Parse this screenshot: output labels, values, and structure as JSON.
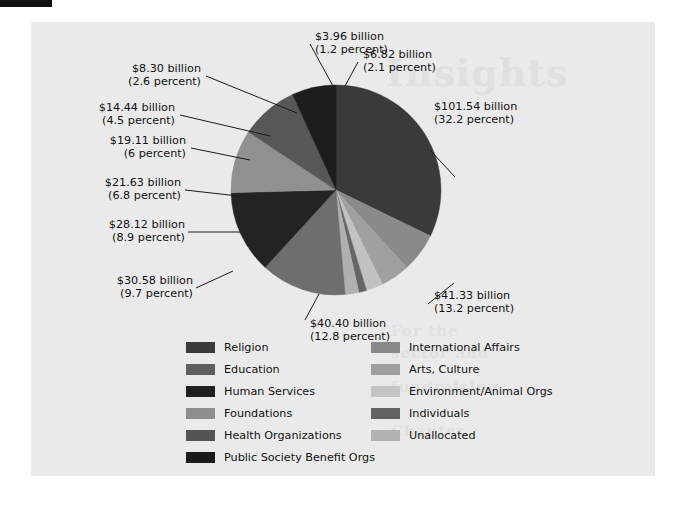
{
  "figure": {
    "background_color": "#eaeaea",
    "page_color": "#ffffff"
  },
  "ghost_text": {
    "line1": "Insights",
    "line2": "For the",
    "line3": "sector and",
    "line4": "fundraising",
    "line5": "Chapter"
  },
  "chart_data": {
    "type": "pie",
    "title": "",
    "subtitle": "",
    "xlabel": "",
    "ylabel": "",
    "legend_position": "bottom",
    "grid": false,
    "value_unit": "billion USD",
    "categories": [
      "Religion",
      "Education",
      "Human Services",
      "Foundations",
      "Health Organizations",
      "Public Society Benefit Orgs",
      "International Affairs",
      "Arts, Culture",
      "Environment/Animal Orgs",
      "Individuals",
      "Unallocated"
    ],
    "values": [
      101.54,
      41.33,
      40.4,
      30.58,
      28.12,
      21.63,
      19.11,
      14.44,
      8.3,
      3.96,
      6.82
    ],
    "percents": [
      32.2,
      13.2,
      12.8,
      9.7,
      8.9,
      6.8,
      6.0,
      4.5,
      2.6,
      1.2,
      2.1
    ],
    "colors": [
      "#3a3a3a",
      "#6e6e6e",
      "#232323",
      "#909090",
      "#575757",
      "#1d1d1d",
      "#8a8a8a",
      "#a0a0a0",
      "#c2c2c2",
      "#666666",
      "#b0b0b0"
    ],
    "slices": [
      {
        "name": "Religion",
        "value": 101.54,
        "percent": 32.2,
        "value_text": "$101.54 billion",
        "percent_text": "(32.2 percent)",
        "color": "#3a3a3a"
      },
      {
        "name": "International Affairs",
        "value": 19.11,
        "percent": 6.0,
        "value_text": "$19.11 billion",
        "percent_text": "(6 percent)",
        "color": "#8a8a8a"
      },
      {
        "name": "Arts, Culture",
        "value": 14.44,
        "percent": 4.5,
        "value_text": "$14.44 billion",
        "percent_text": "(4.5 percent)",
        "color": "#a0a0a0"
      },
      {
        "name": "Environment/Animal Orgs",
        "value": 8.3,
        "percent": 2.6,
        "value_text": "$8.30 billion",
        "percent_text": "(2.6 percent)",
        "color": "#c2c2c2"
      },
      {
        "name": "Individuals",
        "value": 3.96,
        "percent": 1.2,
        "value_text": "$3.96 billion",
        "percent_text": "(1.2 percent)",
        "color": "#666666"
      },
      {
        "name": "Unallocated",
        "value": 6.82,
        "percent": 2.1,
        "value_text": "$6.82 billion",
        "percent_text": "(2.1 percent)",
        "color": "#b0b0b0"
      },
      {
        "name": "Education",
        "value": 41.33,
        "percent": 13.2,
        "value_text": "$41.33 billion",
        "percent_text": "(13.2 percent)",
        "color": "#6e6e6e"
      },
      {
        "name": "Human Services",
        "value": 40.4,
        "percent": 12.8,
        "value_text": "$40.40 billion",
        "percent_text": "(12.8 percent)",
        "color": "#232323"
      },
      {
        "name": "Foundations",
        "value": 30.58,
        "percent": 9.7,
        "value_text": "$30.58 billion",
        "percent_text": "(9.7 percent)",
        "color": "#909090"
      },
      {
        "name": "Health Organizations",
        "value": 28.12,
        "percent": 8.9,
        "value_text": "$28.12 billion",
        "percent_text": "(8.9 percent)",
        "color": "#575757"
      },
      {
        "name": "Public Society Benefit Orgs",
        "value": 21.63,
        "percent": 6.8,
        "value_text": "$21.63 billion",
        "percent_text": "(6.8 percent)",
        "color": "#1d1d1d"
      }
    ]
  },
  "callouts": [
    {
      "id": "religion",
      "value_text": "$101.54 billion",
      "percent_text": "(32.2 percent)"
    },
    {
      "id": "education",
      "value_text": "$41.33 billion",
      "percent_text": "(13.2 percent)"
    },
    {
      "id": "human",
      "value_text": "$40.40 billion",
      "percent_text": "(12.8 percent)"
    },
    {
      "id": "foundations",
      "value_text": "$30.58 billion",
      "percent_text": "(9.7 percent)"
    },
    {
      "id": "health",
      "value_text": "$28.12 billion",
      "percent_text": "(8.9 percent)"
    },
    {
      "id": "public",
      "value_text": "$21.63 billion",
      "percent_text": "(6.8 percent)"
    },
    {
      "id": "intl",
      "value_text": "$19.11 billion",
      "percent_text": "(6 percent)"
    },
    {
      "id": "arts",
      "value_text": "$14.44 billion",
      "percent_text": "(4.5 percent)"
    },
    {
      "id": "environment",
      "value_text": "$8.30 billion",
      "percent_text": "(2.6 percent)"
    },
    {
      "id": "individuals",
      "value_text": "$3.96 billion",
      "percent_text": "(1.2 percent)"
    },
    {
      "id": "unallocated",
      "value_text": "$6.82 billion",
      "percent_text": "(2.1 percent)"
    }
  ],
  "legend": {
    "left_column": [
      {
        "label": "Religion",
        "color": "#3a3a3a"
      },
      {
        "label": "Education",
        "color": "#5e5e5e"
      },
      {
        "label": "Human Services",
        "color": "#202020"
      },
      {
        "label": "Foundations",
        "color": "#8e8e8e"
      },
      {
        "label": "Health Organizations",
        "color": "#545454"
      },
      {
        "label": "Public Society Benefit Orgs",
        "color": "#1b1b1b"
      }
    ],
    "right_column": [
      {
        "label": "International Affairs",
        "color": "#8a8a8a"
      },
      {
        "label": "Arts, Culture",
        "color": "#9e9e9e"
      },
      {
        "label": "Environment/Animal Orgs",
        "color": "#c4c4c4"
      },
      {
        "label": "Individuals",
        "color": "#636363"
      },
      {
        "label": "Unallocated",
        "color": "#b2b2b2"
      }
    ]
  }
}
